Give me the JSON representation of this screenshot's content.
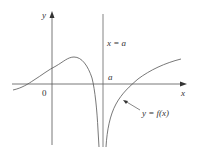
{
  "figure": {
    "type": "function-graph-vertical-asymptote",
    "axes": {
      "x_label": "x",
      "y_label": "y",
      "origin_label": "0"
    },
    "asymptote": {
      "equation_label": "x = a",
      "tick_label": "a"
    },
    "curve": {
      "label": "y = f(x)"
    },
    "colors": {
      "line": "#555555",
      "text": "#333333",
      "background": "#ffffff"
    }
  }
}
